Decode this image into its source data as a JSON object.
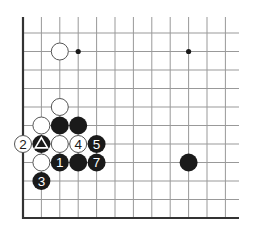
{
  "diagram": {
    "type": "go-board-diagram",
    "grid": {
      "origin_x": 23,
      "origin_y": 33,
      "spacing_x": 18.4,
      "spacing_y": 18.5,
      "cols": 12,
      "rows": 11,
      "h_line_extent_x": 239,
      "top_edge_y": 17,
      "left_border": true,
      "bottom_border": true
    },
    "colors": {
      "line": "#999999",
      "border": "#333333",
      "black_stone": "#1a1a1a",
      "white_stone_fill": "#ffffff",
      "white_stone_stroke": "#555555"
    },
    "star_points": [
      {
        "col": 3,
        "row": 1
      },
      {
        "col": 9,
        "row": 1
      }
    ],
    "stones": [
      {
        "color": "white",
        "col": 2,
        "row": 1,
        "label": ""
      },
      {
        "color": "white",
        "col": 2,
        "row": 4,
        "label": ""
      },
      {
        "color": "white",
        "col": 1,
        "row": 5,
        "label": ""
      },
      {
        "color": "black",
        "col": 2,
        "row": 5,
        "label": ""
      },
      {
        "color": "black",
        "col": 3,
        "row": 5,
        "label": ""
      },
      {
        "color": "white",
        "col": 0,
        "row": 6,
        "label": "2"
      },
      {
        "color": "black",
        "col": 1,
        "row": 6,
        "label": "",
        "marker": "triangle"
      },
      {
        "color": "white",
        "col": 2,
        "row": 6,
        "label": ""
      },
      {
        "color": "white",
        "col": 3,
        "row": 6,
        "label": "4"
      },
      {
        "color": "black",
        "col": 4,
        "row": 6,
        "label": "5"
      },
      {
        "color": "white",
        "col": 1,
        "row": 7,
        "label": ""
      },
      {
        "color": "black",
        "col": 2,
        "row": 7,
        "label": "1"
      },
      {
        "color": "black",
        "col": 3,
        "row": 7,
        "label": ""
      },
      {
        "color": "black",
        "col": 4,
        "row": 7,
        "label": "7"
      },
      {
        "color": "black",
        "col": 1,
        "row": 8,
        "label": "3"
      },
      {
        "color": "black",
        "col": 9,
        "row": 7,
        "label": ""
      }
    ]
  }
}
